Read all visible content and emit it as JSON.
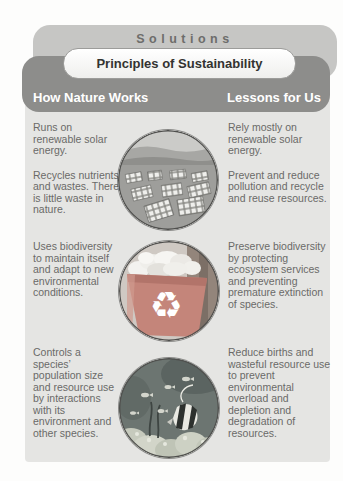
{
  "header": {
    "title": "Solutions",
    "banner": "Principles of Sustainability",
    "column_left": "How Nature Works",
    "column_right": "Lessons for Us"
  },
  "rows": [
    {
      "image": "solar-panel-field-photo",
      "nature": [
        "Runs on renewable solar energy.",
        "Recycles nutrients and wastes. There is little waste in nature."
      ],
      "lessons": [
        "Rely mostly on renewable solar energy.",
        "Prevent and reduce pollution and recycle and reuse resources."
      ]
    },
    {
      "image": "recycling-bin-photo",
      "nature": [
        "Uses biodiversity to maintain itself and adapt to new environ­mental conditions."
      ],
      "lessons": [
        "Preserve biodiversity by protecting ecosystem services and preventing premature extinction of species."
      ]
    },
    {
      "image": "coral-reef-fish-photo",
      "nature": [
        "Controls a species’ population size and resource use by interactions with its environment and other species."
      ],
      "lessons": [
        "Reduce births and wasteful resource use to prevent environmental overload and depletion and degradation of resources."
      ]
    }
  ],
  "icons": {
    "recycle_symbol": "♻"
  },
  "colors": {
    "solutions_band": "#c6c6c4",
    "header_band": "#8d8d8b",
    "content_bg": "#e5e5e3",
    "body_text": "#6a6a68",
    "heading_text": "#ffffff",
    "bin_red": "#c4857a"
  }
}
